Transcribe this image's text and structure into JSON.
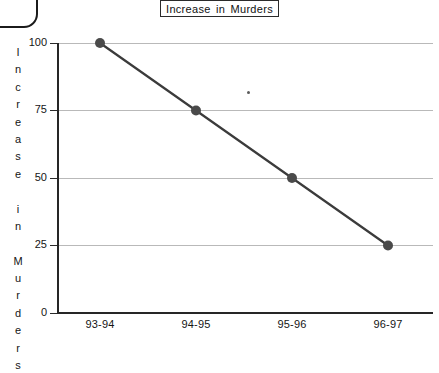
{
  "chart_data": {
    "type": "line",
    "title": "Increase in Murders",
    "xlabel": "",
    "ylabel": "Increase in Murders",
    "categories": [
      "93-94",
      "94-95",
      "95-96",
      "96-97"
    ],
    "values": [
      100,
      75,
      50,
      25
    ],
    "series": [
      {
        "name": "Increase in Murders",
        "values": [
          100,
          75,
          50,
          25
        ]
      }
    ],
    "ylim": [
      0,
      100
    ],
    "yticks": [
      0,
      25,
      50,
      75,
      100
    ],
    "ytick_labels": [
      "0",
      "25",
      "50",
      "75",
      "100"
    ],
    "grid": "horizontal",
    "legend": "none",
    "marker": "filled-circle",
    "line_color": "#3b3b3b",
    "marker_color": "#4a4a4a",
    "grid_color": "#b9b9b9",
    "axis_color": "#262626",
    "background": "#ffffff"
  },
  "title_box": {
    "text": "Increase in Murders"
  },
  "y_axis": {
    "title_chars": [
      "I",
      "n",
      "c",
      "r",
      "e",
      "a",
      "s",
      "e",
      " ",
      "i",
      "n",
      " ",
      "M",
      "u",
      "r",
      "d",
      "e",
      "r",
      "s"
    ],
    "ticks": [
      {
        "label": "100",
        "value": 100
      },
      {
        "label": "75",
        "value": 75
      },
      {
        "label": "50",
        "value": 50
      },
      {
        "label": "25",
        "value": 25
      },
      {
        "label": "0",
        "value": 0
      }
    ]
  },
  "x_axis": {
    "ticks": [
      {
        "label": "93-94"
      },
      {
        "label": "94-95"
      },
      {
        "label": "95-96"
      },
      {
        "label": "96-97"
      }
    ]
  },
  "artifacts": {
    "corner_shape": "rounded-rectangle-corner",
    "speck": "scan-speck"
  }
}
